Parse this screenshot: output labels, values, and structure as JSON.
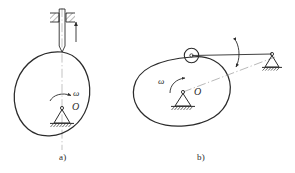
{
  "figure": {
    "background_color": "#ffffff",
    "line_color": "#2b2b2b",
    "hatch_color": "#2b2b2b",
    "centerline_color": "#8a8a8a"
  },
  "panel_a": {
    "caption": "a)",
    "description": "Disc cam with knife-edge translating follower in a guide",
    "cam": {
      "pivot_label": "O",
      "angular_velocity_label": "ω",
      "rotation_direction": "counterclockwise"
    },
    "follower": {
      "type": "knife-edge translating follower",
      "motion_arrow": "up",
      "guide": "hatched fixed guide block, both sides"
    },
    "support": {
      "type": "fixed pivot triangle with ground hatching"
    }
  },
  "panel_b": {
    "caption": "b)",
    "description": "Disc cam with roller oscillating follower (rocker arm)",
    "cam": {
      "pivot_label": "O",
      "angular_velocity_label": "ω",
      "rotation_direction": "counterclockwise"
    },
    "follower": {
      "type": "roller oscillating follower",
      "roller": "roller wheel with center pin",
      "motion_arrow": "double-headed oscillation arc",
      "link": "rocker arm from roller to right fixed pivot"
    },
    "support_left": {
      "type": "fixed pivot triangle with ground hatching"
    },
    "support_right": {
      "type": "fixed pivot triangle with ground hatching"
    },
    "centerline": "dash-dot line from cam pivot to right pivot"
  }
}
